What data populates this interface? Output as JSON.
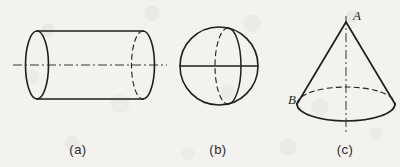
{
  "figure": {
    "background_color": "#f3f2ef",
    "ink_color": "#1f1f1f",
    "panels": [
      {
        "id": "panel-a",
        "caption": "(a)",
        "shape": "cylinder",
        "caption_x": 78,
        "caption_y": 142,
        "axis": "horizontal dash-dot axis of revolution"
      },
      {
        "id": "panel-b",
        "caption": "(b)",
        "shape": "sphere",
        "caption_x": 218,
        "caption_y": 142,
        "axis": "horizontal diameter line"
      },
      {
        "id": "panel-c",
        "caption": "(c)",
        "shape": "cone",
        "caption_x": 345,
        "caption_y": 142,
        "axis": "vertical dash-dot axis of revolution"
      }
    ],
    "labels": [
      {
        "id": "label-a",
        "text": "A",
        "x": 353,
        "y": 8,
        "note": "cone apex"
      },
      {
        "id": "label-b",
        "text": "B",
        "x": 288,
        "y": 92,
        "note": "point on cone base circle"
      }
    ]
  }
}
